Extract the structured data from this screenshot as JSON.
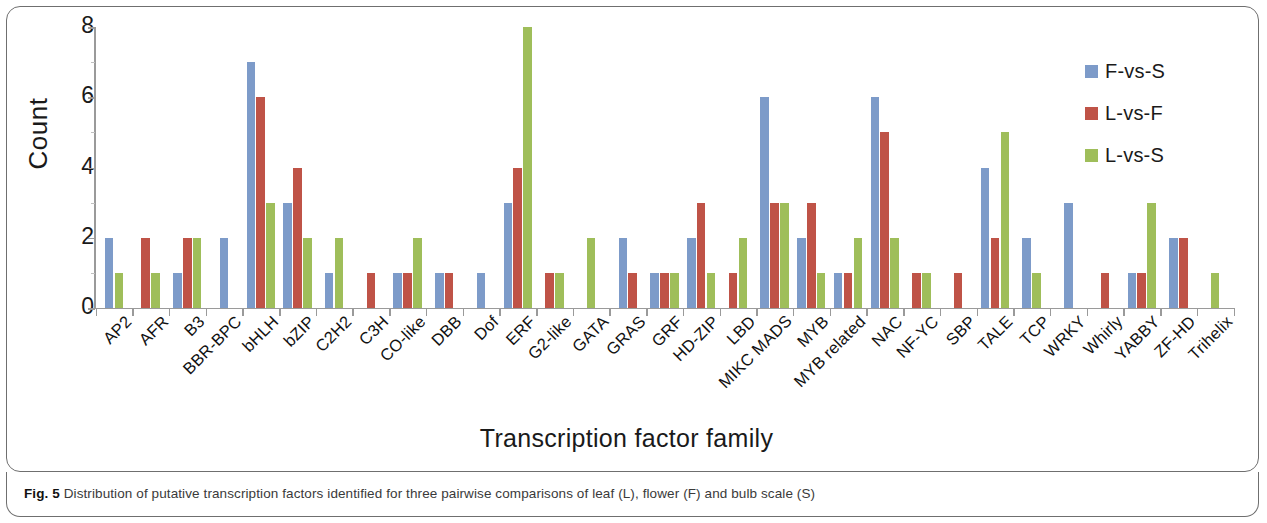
{
  "figure": {
    "caption_prefix": "Fig. 5",
    "caption_text": " Distribution of putative transcription factors identified for three pairwise comparisons of leaf (L), flower (F) and bulb scale (S)"
  },
  "legend": {
    "position": "top-right",
    "entries": [
      {
        "label": "F-vs-S",
        "color": "#7d9bc9"
      },
      {
        "label": "L-vs-F",
        "color": "#bf5347"
      },
      {
        "label": "L-vs-S",
        "color": "#9fbe5a"
      }
    ]
  },
  "axes": {
    "ylabel": "Count",
    "xlabel": "Transcription factor family",
    "yticks": [
      "0",
      "2",
      "4",
      "6",
      "8"
    ]
  },
  "chart_data": {
    "type": "bar",
    "title": "",
    "xlabel": "Transcription factor family",
    "ylabel": "Count",
    "ylim": [
      0,
      8
    ],
    "ytick_values": [
      0,
      2,
      4,
      6,
      8
    ],
    "grid": false,
    "legend_position": "top-right",
    "categories": [
      "AP2",
      "AFR",
      "B3",
      "BBR-BPC",
      "bHLH",
      "bZIP",
      "C2H2",
      "C3H",
      "CO-like",
      "DBB",
      "Dof",
      "ERF",
      "G2-like",
      "GATA",
      "GRAS",
      "GRF",
      "HD-ZIP",
      "LBD",
      "MIKC MADS",
      "MYB",
      "MYB related",
      "NAC",
      "NF-YC",
      "SBP",
      "TALE",
      "TCP",
      "WRKY",
      "Whirly",
      "YABBY",
      "ZF-HD",
      "Trihelix"
    ],
    "series": [
      {
        "name": "F-vs-S",
        "color": "#7d9bc9",
        "values": [
          2,
          0,
          1,
          2,
          7,
          3,
          1,
          0,
          1,
          1,
          1,
          3,
          0,
          0,
          2,
          1,
          2,
          0,
          6,
          2,
          1,
          6,
          0,
          0,
          4,
          2,
          3,
          0,
          1,
          2,
          0
        ]
      },
      {
        "name": "L-vs-F",
        "color": "#bf5347",
        "values": [
          0,
          2,
          2,
          0,
          6,
          4,
          0,
          1,
          1,
          1,
          0,
          4,
          1,
          0,
          1,
          1,
          3,
          1,
          3,
          3,
          1,
          5,
          1,
          1,
          2,
          0,
          0,
          1,
          1,
          2,
          0
        ]
      },
      {
        "name": "L-vs-S",
        "color": "#9fbe5a",
        "values": [
          1,
          1,
          2,
          0,
          3,
          2,
          2,
          0,
          2,
          0,
          0,
          8,
          1,
          2,
          0,
          1,
          1,
          2,
          3,
          1,
          2,
          2,
          1,
          0,
          5,
          1,
          0,
          0,
          3,
          0,
          1
        ]
      }
    ]
  }
}
